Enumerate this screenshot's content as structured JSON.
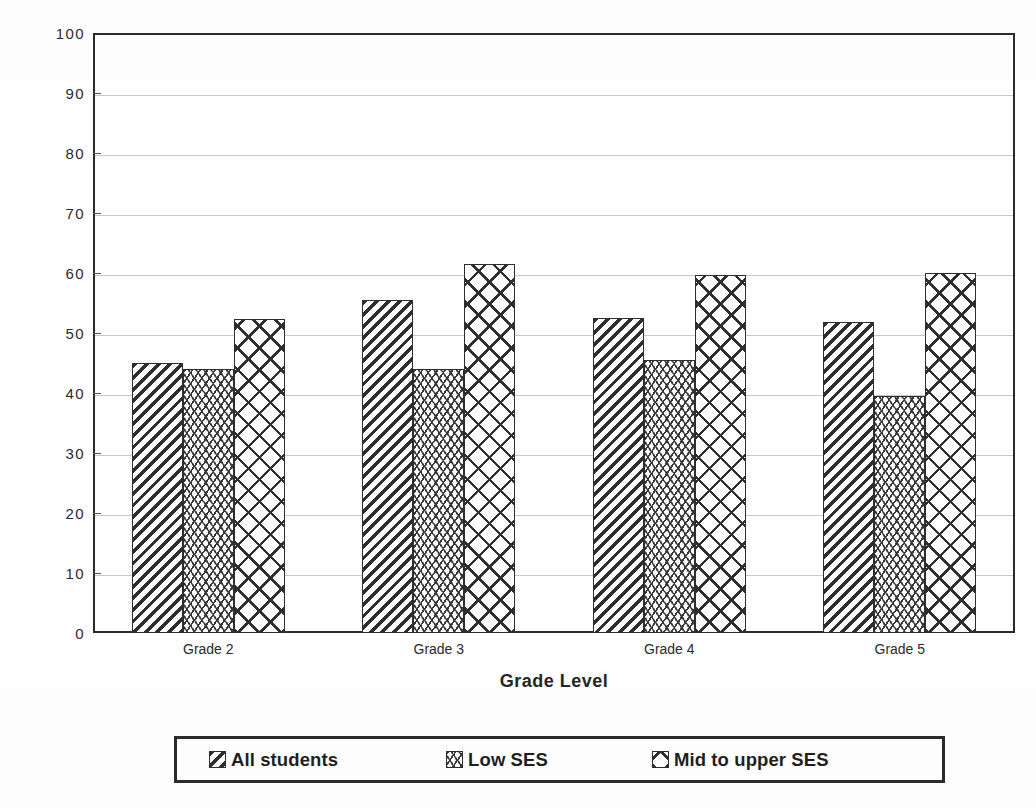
{
  "chart_data": {
    "type": "bar",
    "title": "",
    "xlabel": "Grade Level",
    "ylabel": "Math Scores (Percentiles)",
    "categories": [
      "Grade 2",
      "Grade 3",
      "Grade 4",
      "Grade 5"
    ],
    "series": [
      {
        "name": "All  students",
        "pattern": "diagonal-hatch",
        "values": [
          45,
          55.5,
          52.5,
          51.8
        ]
      },
      {
        "name": "Low SES",
        "pattern": "wavy-hatch",
        "values": [
          44,
          44,
          45.5,
          39.5
        ]
      },
      {
        "name": "Mid to upper SES",
        "pattern": "cross-hatch",
        "values": [
          52.3,
          61.5,
          59.7,
          60
        ]
      }
    ],
    "ylim": [
      0,
      100
    ],
    "ytick_step": 10,
    "yticks": [
      0,
      10,
      20,
      30,
      40,
      50,
      60,
      70,
      80,
      90,
      100
    ],
    "ytick_labels": [
      "0",
      "10",
      "20",
      "30",
      "40",
      "50",
      "60",
      "70",
      "80",
      "90",
      "100"
    ],
    "grid": true,
    "grid_axis": "y",
    "legend_position": "bottom",
    "colors": {
      "ink": "#2b2b2b",
      "gridline": "#c8c8c8",
      "bar_fill": "#ffffff",
      "bar_edge": "#2e2e2e"
    }
  },
  "axes": {
    "y_title": "Math Scores (Percentiles)",
    "x_title": "Grade Level"
  },
  "legend": {
    "items": [
      {
        "label": "All  students",
        "swatch": "diagonal-hatch-swatch"
      },
      {
        "label": "Low SES",
        "swatch": "wavy-hatch-swatch"
      },
      {
        "label": "Mid to upper SES",
        "swatch": "cross-hatch-swatch"
      }
    ]
  }
}
